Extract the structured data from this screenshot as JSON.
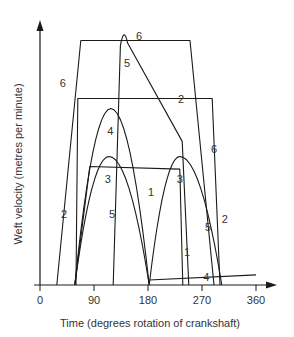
{
  "chart_data": {
    "type": "line",
    "title": "",
    "xlabel": "Time (degrees rotation of crankshaft)",
    "ylabel": "Weft velocity (metres per minute)",
    "xlim": [
      0,
      360
    ],
    "ylim": [
      0,
      100
    ],
    "x_ticks": [
      0,
      90,
      180,
      270,
      360
    ],
    "x_tick_labels": [
      "0",
      "90",
      "180",
      "270",
      "360"
    ],
    "y_ticks": [],
    "grid": false,
    "legend": "none (curves labelled inline with numbers 1-6)",
    "series": [
      {
        "name": "1",
        "points": [
          [
            58,
            0
          ],
          [
            83,
            47
          ],
          [
            233,
            46
          ],
          [
            238,
            0
          ]
        ]
      },
      {
        "name": "2",
        "points": [
          [
            60,
            0
          ],
          [
            63,
            74
          ],
          [
            287,
            74
          ],
          [
            300,
            0
          ]
        ]
      },
      {
        "name": "3",
        "shape": "two parabolic arches",
        "points": [
          [
            58,
            0
          ],
          [
            70,
            30
          ],
          [
            85,
            45
          ],
          [
            115,
            51
          ],
          [
            135,
            35
          ],
          [
            150,
            18
          ],
          [
            182,
            0
          ],
          [
            195,
            20
          ],
          [
            215,
            45
          ],
          [
            233,
            51
          ],
          [
            260,
            35
          ],
          [
            280,
            15
          ],
          [
            303,
            0
          ]
        ]
      },
      {
        "name": "4",
        "shape": "parabolic arch then near-flat line",
        "points": [
          [
            58,
            0
          ],
          [
            75,
            45
          ],
          [
            90,
            62
          ],
          [
            118,
            70
          ],
          [
            140,
            55
          ],
          [
            160,
            30
          ],
          [
            182,
            0
          ],
          [
            182,
            2
          ],
          [
            360,
            4
          ]
        ]
      },
      {
        "name": "5",
        "points": [
          [
            122,
            0
          ],
          [
            135,
            97
          ],
          [
            140,
            99
          ],
          [
            145,
            97
          ],
          [
            237,
            57
          ],
          [
            248,
            0
          ]
        ]
      },
      {
        "name": "6",
        "points": [
          [
            28,
            0
          ],
          [
            68,
            97
          ],
          [
            250,
            97
          ],
          [
            290,
            0
          ]
        ]
      }
    ],
    "labels": [
      {
        "text": "6",
        "x": 165,
        "y": 99
      },
      {
        "text": "5",
        "x": 145,
        "y": 88
      },
      {
        "text": "6",
        "x": 38,
        "y": 80
      },
      {
        "text": "2",
        "x": 235,
        "y": 74
      },
      {
        "text": "6",
        "x": 290,
        "y": 54
      },
      {
        "text": "4",
        "x": 117,
        "y": 61
      },
      {
        "text": "3",
        "x": 113,
        "y": 42
      },
      {
        "text": "3",
        "x": 233,
        "y": 42
      },
      {
        "text": "1",
        "x": 185,
        "y": 37
      },
      {
        "text": "5",
        "x": 120,
        "y": 28
      },
      {
        "text": "2",
        "x": 40,
        "y": 28
      },
      {
        "text": "5",
        "x": 280,
        "y": 23
      },
      {
        "text": "2",
        "x": 308,
        "y": 26
      },
      {
        "text": "1",
        "x": 245,
        "y": 13
      },
      {
        "text": "4",
        "x": 277,
        "y": 3
      }
    ]
  }
}
